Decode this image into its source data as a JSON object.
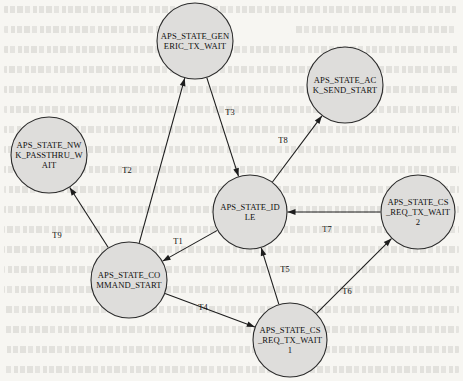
{
  "diagram": {
    "type": "state-machine",
    "node_fill": "#dedddb",
    "node_stroke": "#2b2b2b",
    "edge_color": "#1d1d1d",
    "background": "#f7f6f2",
    "nodes": [
      {
        "id": "generic_tx_wait",
        "name": "APS_STATE_GENERIC_TX_WAIT",
        "lines": [
          "APS_STATE_GEN",
          "ERIC_TX_WAIT"
        ],
        "cx": 195,
        "cy": 41,
        "r": 38
      },
      {
        "id": "ack_send_start",
        "name": "APS_STATE_ACK_SEND_START",
        "lines": [
          "APS_STATE_AC",
          "K_SEND_START"
        ],
        "cx": 345,
        "cy": 85,
        "r": 38
      },
      {
        "id": "nwk_passthru_wait",
        "name": "APS_STATE_NWK_PASSTHRU_WAIT",
        "lines": [
          "APS_STATE_NW",
          "K_PASSTHRU_W",
          "AIT"
        ],
        "cx": 49,
        "cy": 155,
        "r": 38
      },
      {
        "id": "idle",
        "name": "APS_STATE_IDLE",
        "lines": [
          "APS_STATE_ID",
          "LE"
        ],
        "cx": 250,
        "cy": 212,
        "r": 37
      },
      {
        "id": "cs_req_tx_wait_2",
        "name": "APS_STATE_CS_REQ_TX_WAIT2",
        "lines": [
          "APS_STATE_CS",
          "_REQ_TX_WAIT",
          "2"
        ],
        "cx": 418,
        "cy": 212,
        "r": 37
      },
      {
        "id": "command_start",
        "name": "APS_STATE_COMMAND_START",
        "lines": [
          "APS_STATE_CO",
          "MMAND_START"
        ],
        "cx": 129,
        "cy": 280,
        "r": 38
      },
      {
        "id": "cs_req_tx_wait_1",
        "name": "APS_STATE_CS_REQ_TX_WAIT1",
        "lines": [
          "APS_STATE_CS",
          "_REQ_TX_WAIT",
          "1"
        ],
        "cx": 290,
        "cy": 340,
        "r": 37
      }
    ],
    "edges": [
      {
        "id": "T1",
        "label": "T1",
        "from": "idle",
        "to": "command_start",
        "label_x": 178,
        "label_y": 244
      },
      {
        "id": "T2",
        "label": "T2",
        "from": "command_start",
        "to": "generic_tx_wait",
        "label_x": 127,
        "label_y": 173
      },
      {
        "id": "T3",
        "label": "T3",
        "from": "generic_tx_wait",
        "to": "idle",
        "label_x": 230,
        "label_y": 115
      },
      {
        "id": "T4",
        "label": "T4",
        "from": "command_start",
        "to": "cs_req_tx_wait_1",
        "label_x": 203,
        "label_y": 310
      },
      {
        "id": "T5",
        "label": "T5",
        "from": "cs_req_tx_wait_1",
        "to": "idle",
        "label_x": 285,
        "label_y": 272
      },
      {
        "id": "T6",
        "label": "T6",
        "from": "cs_req_tx_wait_1",
        "to": "cs_req_tx_wait_2",
        "label_x": 347,
        "label_y": 294
      },
      {
        "id": "T7",
        "label": "T7",
        "from": "cs_req_tx_wait_2",
        "to": "idle",
        "label_x": 327,
        "label_y": 232
      },
      {
        "id": "T8",
        "label": "T8",
        "from": "idle",
        "to": "ack_send_start",
        "label_x": 283,
        "label_y": 143
      },
      {
        "id": "T9",
        "label": "T9",
        "from": "command_start",
        "to": "nwk_passthru_wait",
        "label_x": 57,
        "label_y": 238
      }
    ]
  }
}
